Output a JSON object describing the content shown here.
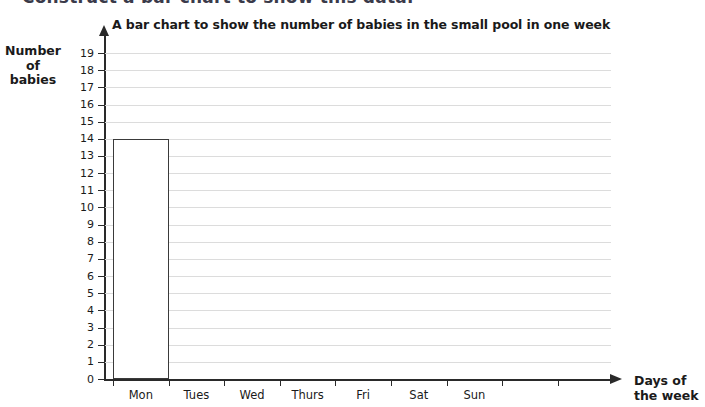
{
  "instruction": "Construct a bar chart to show this data.",
  "axis_titles": {
    "y_lines": [
      "Number",
      "of",
      "babies"
    ],
    "x_lines": [
      "Days of",
      "the week"
    ]
  },
  "colors": {
    "gridline": "#dcdcdc",
    "axis": "#2a2a2a",
    "bar_outline": "#3a3a3a",
    "bar_fill": "#ffffff",
    "text": "#1a1a1a"
  },
  "chart_data": {
    "type": "bar",
    "title": "A bar chart to show the number of babies in the small pool in one week",
    "xlabel": "Days of the week",
    "ylabel": "Number of babies",
    "categories": [
      "Mon",
      "Tues",
      "Wed",
      "Thurs",
      "Fri",
      "Sat",
      "Sun"
    ],
    "values": [
      14,
      null,
      null,
      null,
      null,
      null,
      null
    ],
    "ylim": [
      0,
      19
    ],
    "ytick_labels": [
      "0",
      "1",
      "2",
      "3",
      "4",
      "5",
      "6",
      "7",
      "8",
      "9",
      "10",
      "11",
      "12",
      "13",
      "14",
      "15",
      "16",
      "17",
      "18",
      "19"
    ],
    "grid": true,
    "legend": null,
    "bar_style": "outline-only",
    "note": "Only the Monday bar is drawn; remaining days are blank for the pupil to complete."
  }
}
